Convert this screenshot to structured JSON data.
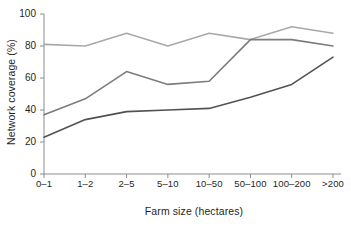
{
  "chart_data": {
    "type": "line",
    "title": "",
    "xlabel": "Farm size (hectares)",
    "ylabel": "Network coverage (%)",
    "categories": [
      "0–1",
      "1–2",
      "2–5",
      "5–10",
      "10–50",
      "50–100",
      "100–200",
      ">200"
    ],
    "ylim": [
      0,
      100
    ],
    "yticks": [
      0,
      20,
      40,
      60,
      80,
      100
    ],
    "grid": false,
    "legend": "none",
    "series": [
      {
        "name": "light-gray-series",
        "color": "#a9a9a9",
        "values": [
          81,
          80,
          88,
          80,
          88,
          84,
          92,
          88
        ]
      },
      {
        "name": "medium-gray-series",
        "color": "#7c7c7c",
        "values": [
          37,
          47,
          64,
          56,
          58,
          84,
          84,
          80
        ]
      },
      {
        "name": "dark-gray-series",
        "color": "#525252",
        "values": [
          23,
          34,
          39,
          40,
          41,
          48,
          56,
          73
        ]
      }
    ]
  },
  "axis": {
    "tick_labels_y": [
      "0",
      "20",
      "40",
      "60",
      "80",
      "100"
    ],
    "axis_color": "#8c8c8c"
  }
}
